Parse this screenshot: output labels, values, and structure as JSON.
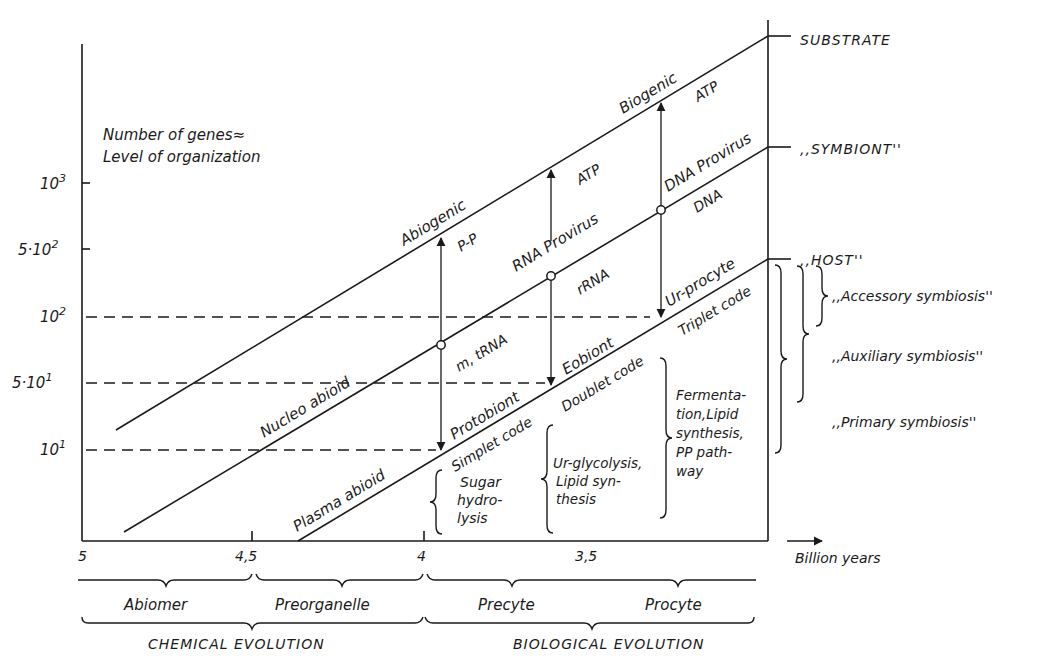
{
  "diagram": {
    "y_axis_title_line1": "Number of genes≈",
    "y_axis_title_line2": "Level of organization",
    "y_ticks": [
      {
        "label": "10",
        "exp": "3",
        "prefix": ""
      },
      {
        "label": "10",
        "exp": "2",
        "prefix": "5·"
      },
      {
        "label": "10",
        "exp": "2",
        "prefix": ""
      },
      {
        "label": "10",
        "exp": "1",
        "prefix": "5·"
      },
      {
        "label": "10",
        "exp": "1",
        "prefix": ""
      }
    ],
    "x_ticks": [
      "5",
      "4,5",
      "4",
      "3,5"
    ],
    "x_axis_label": "Billion years",
    "levels": {
      "top": "SUBSTRATE",
      "middle": ",,SYMBIONT''",
      "bottom": ",,HOST''"
    },
    "line_labels": {
      "top_left": "Abiogenic",
      "top_right": "Biogenic",
      "middle_left": "Nucleo  abioid",
      "middle_center": "RNA  Provirus",
      "middle_right": "DNA Provirus",
      "bottom_left": "Plasma abioid",
      "bottom_protobiont": "Protobiont",
      "bottom_eobiont": "Eobiont",
      "bottom_urprocyte": "Ur-procyte",
      "code_simplet": "Simplet code",
      "code_doublet": "Doublet code",
      "code_triplet": "Triplet code"
    },
    "arrow_labels": {
      "pp": "P-P",
      "atp1": "ATP",
      "atp2": "ATP",
      "mtrna": "m, tRNA",
      "rrna": "rRNA",
      "dna": "DNA"
    },
    "metabolism": {
      "sugar": [
        "Sugar",
        "hydro-",
        "lysis"
      ],
      "glycolysis": [
        "Ur-glycolysis,",
        "Lipid syn-",
        "thesis"
      ],
      "fermentation": [
        "Fermenta-",
        "tion,Lipid",
        "synthesis,",
        "PP path-",
        "way"
      ]
    },
    "symbiosis": {
      "accessory": ",,Accessory symbiosis''",
      "auxiliary": ",,Auxiliary  symbiosis''",
      "primary": ",,Primary symbiosis''"
    },
    "stages": [
      "Abiomer",
      "Preorganelle",
      "Precyte",
      "Procyte"
    ],
    "eras": [
      "CHEMICAL  EVOLUTION",
      "BIOLOGICAL  EVOLUTION"
    ]
  }
}
